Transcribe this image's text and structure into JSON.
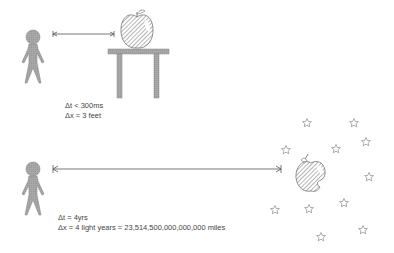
{
  "scenes": {
    "near": {
      "delta_t": "Δt < 300ms",
      "delta_x": "Δx = 3 feet"
    },
    "far": {
      "delta_t": "Δt = 4yrs",
      "delta_x": "Δx = 4 light years = 23,514,500,000,000,000 miles"
    }
  },
  "colors": {
    "figure_fill": "#a9a9a9",
    "line": "#555555",
    "text": "#444444"
  }
}
